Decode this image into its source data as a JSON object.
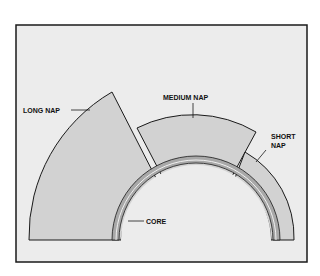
{
  "diagram": {
    "labels": {
      "long_nap": "LONG NAP",
      "medium_nap": "MEDIUM NAP",
      "short_nap_line1": "SHORT",
      "short_nap_line2": "NAP",
      "core": "CORE"
    },
    "colors": {
      "background": "#ececec",
      "nap_fill": "#d2d2d2",
      "core_fill": "#a8a8a8",
      "stroke": "#1a1a1a"
    }
  }
}
